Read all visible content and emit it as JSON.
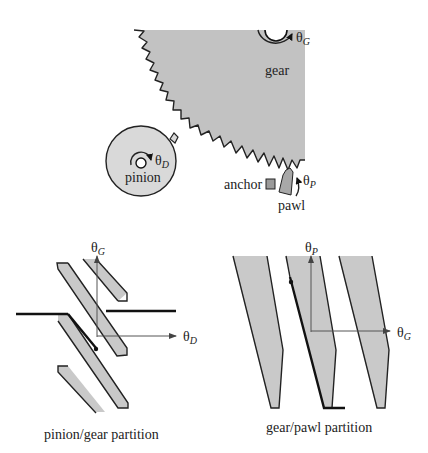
{
  "mechanism": {
    "gear": {
      "label": "gear",
      "angle_symbol": "θ",
      "angle_subscript": "G"
    },
    "pinion": {
      "label": "pinion",
      "angle_symbol": "θ",
      "angle_subscript": "D"
    },
    "anchor": {
      "label": "anchor"
    },
    "pawl": {
      "label": "pawl",
      "angle_symbol": "θ",
      "angle_subscript": "P"
    },
    "colors": {
      "gear_fill": "#c2c2c2",
      "pinion_fill": "#d9d9d9",
      "anchor_fill": "#9a9a9a",
      "pawl_fill": "#a8a8a8"
    }
  },
  "pinion_gear_partition": {
    "caption": "pinion/gear partition",
    "x_axis": {
      "symbol": "θ",
      "subscript": "D"
    },
    "y_axis": {
      "symbol": "θ",
      "subscript": "G"
    },
    "region_fill": "#cccccc"
  },
  "gear_pawl_partition": {
    "caption": "gear/pawl partition",
    "x_axis": {
      "symbol": "θ",
      "subscript": "G"
    },
    "y_axis": {
      "symbol": "θ",
      "subscript": "P"
    },
    "region_fill": "#cccccc"
  }
}
